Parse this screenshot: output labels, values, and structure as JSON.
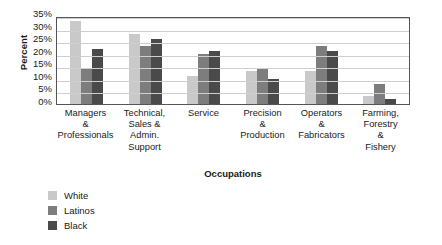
{
  "chart_data": {
    "type": "bar",
    "title": "",
    "xlabel": "Occupations",
    "ylabel": "Percent",
    "ylim": [
      0,
      35
    ],
    "ytick_labels": [
      "35%",
      "30%",
      "25%",
      "20%",
      "15%",
      "10%",
      "5%",
      "0%"
    ],
    "ytick_values": [
      35,
      30,
      25,
      20,
      15,
      10,
      5,
      0
    ],
    "grid": true,
    "legend_position": "bottom-left",
    "categories": [
      "Managers & Professionals",
      "Technical, Sales & Admin. Support",
      "Service",
      "Precision & Production",
      "Operators & Fabricators",
      "Farming, Forestry & Fishery"
    ],
    "category_lines": [
      [
        "Managers",
        "&",
        "Professionals"
      ],
      [
        "Technical,",
        "Sales &",
        "Admin.",
        "Support"
      ],
      [
        "Service"
      ],
      [
        "Precision",
        "&",
        "Production"
      ],
      [
        "Operators",
        "&",
        "Fabricators"
      ],
      [
        "Farming,",
        "Forestry",
        "&",
        "Fishery"
      ]
    ],
    "series": [
      {
        "name": "White",
        "color": "#c9c9c9",
        "values": [
          33,
          28,
          11,
          13,
          13,
          3
        ]
      },
      {
        "name": "Latinos",
        "color": "#7d7d7d",
        "values": [
          14,
          23,
          20,
          14,
          23,
          8
        ]
      },
      {
        "name": "Black",
        "color": "#4a4a4a",
        "values": [
          22,
          26,
          21,
          10,
          21,
          2
        ]
      }
    ]
  }
}
